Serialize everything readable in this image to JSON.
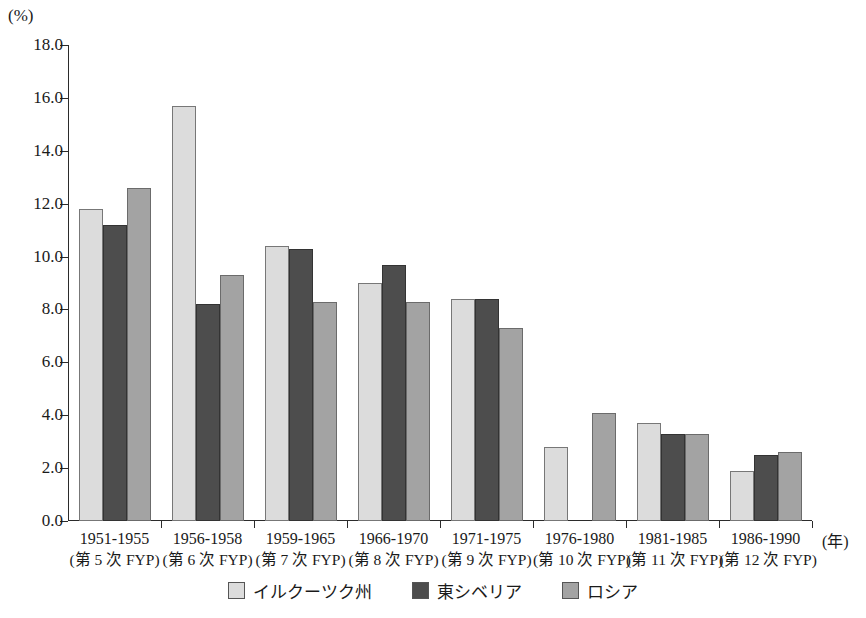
{
  "chart_data": {
    "type": "bar",
    "title": "",
    "subtitle": "",
    "unit_label": "(%)",
    "xlabel": "(年)",
    "ylabel": "",
    "ylim": [
      0.0,
      18.0
    ],
    "ytick_step": 2.0,
    "yticks": [
      "18.0",
      "16.0",
      "14.0",
      "12.0",
      "10.0",
      "8.0",
      "6.0",
      "4.0",
      "2.0",
      "0.0"
    ],
    "grid": false,
    "legend_position": "bottom-center",
    "categories": [
      "1951-1955",
      "1956-1958",
      "1959-1965",
      "1966-1970",
      "1971-1975",
      "1976-1980",
      "1981-1985",
      "1986-1990"
    ],
    "category_sublabels": [
      "(第 5 次 FYP)",
      "(第 6 次 FYP)",
      "(第 7 次 FYP)",
      "(第 8 次 FYP)",
      "(第 9 次 FYP)",
      "(第 10 次 FYP)",
      "(第 11 次 FYP)",
      "(第 12 次 FYP)"
    ],
    "series": [
      {
        "name": "イルクーツク州",
        "color": "#dcdcdc",
        "values": [
          11.8,
          15.7,
          10.4,
          9.0,
          8.4,
          2.8,
          3.7,
          1.9
        ]
      },
      {
        "name": "東シベリア",
        "color": "#4d4d4d",
        "values": [
          11.2,
          8.2,
          10.3,
          9.7,
          8.4,
          null,
          3.3,
          2.5
        ]
      },
      {
        "name": "ロシア",
        "color": "#a3a3a3",
        "values": [
          12.6,
          9.3,
          8.3,
          8.3,
          7.3,
          4.1,
          3.3,
          2.6
        ]
      }
    ]
  }
}
